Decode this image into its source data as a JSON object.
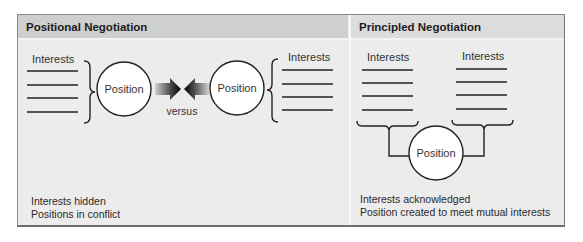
{
  "panels": {
    "positional": {
      "title": "Positional Negotiation",
      "left_interests_label": "Interests",
      "right_interests_label": "Interests",
      "left_position_label": "Position",
      "right_position_label": "Position",
      "versus_label": "versus",
      "captions": [
        "Interests hidden",
        "Positions in conflict"
      ]
    },
    "principled": {
      "title": "Principled Negotiation",
      "left_interests_label": "Interests",
      "right_interests_label": "Interests",
      "position_label": "Position",
      "captions": [
        "Interests acknowledged",
        "Position created to meet mutual interests"
      ]
    }
  },
  "colors": {
    "frame_bg": "#ececec",
    "header_bg": "#cfcfcf",
    "line": "#222222",
    "circle_fill": "#ffffff"
  }
}
